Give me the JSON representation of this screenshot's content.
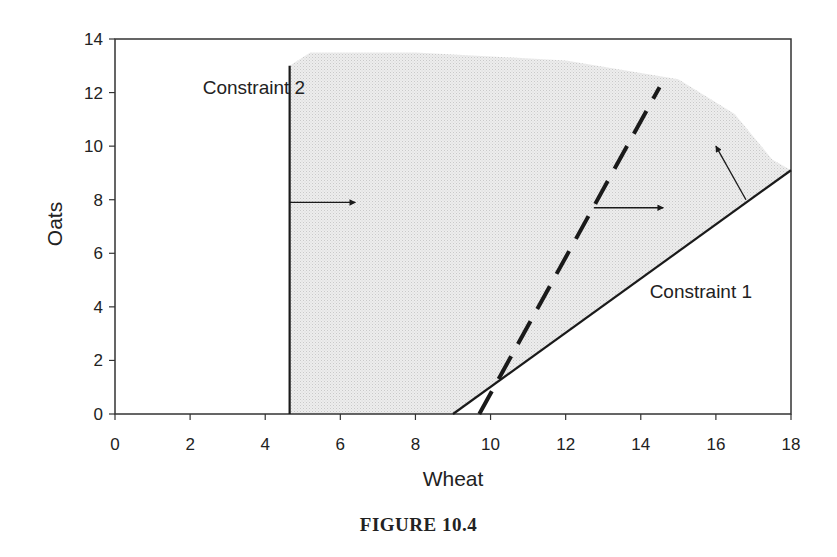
{
  "caption": "FIGURE 10.4",
  "chart_data": {
    "type": "line",
    "title": "",
    "xlabel": "Wheat",
    "ylabel": "Oats",
    "xlim": [
      0,
      18
    ],
    "ylim": [
      0,
      14
    ],
    "xticks": [
      0,
      2,
      4,
      6,
      8,
      10,
      12,
      14,
      16,
      18
    ],
    "yticks": [
      0,
      2,
      4,
      6,
      8,
      10,
      12,
      14
    ],
    "grid": false,
    "legend": null,
    "series": [
      {
        "name": "Constraint 1",
        "style": "solid",
        "x": [
          9.0,
          18.0
        ],
        "y": [
          0.0,
          9.1
        ],
        "direction_arrow": {
          "from": [
            16.8,
            8.0
          ],
          "to": [
            16.0,
            10.0
          ]
        }
      },
      {
        "name": "Constraint 2",
        "style": "solid",
        "x": [
          4.65,
          4.65
        ],
        "y": [
          0.0,
          13.0
        ],
        "direction_arrow": {
          "from": [
            4.65,
            7.9
          ],
          "to": [
            6.4,
            7.9
          ]
        }
      },
      {
        "name": "Objective / additional constraint (dashed)",
        "style": "dashed",
        "x": [
          9.7,
          14.5
        ],
        "y": [
          0.0,
          12.2
        ],
        "direction_arrow": {
          "from": [
            12.75,
            7.7
          ],
          "to": [
            14.6,
            7.7
          ]
        }
      }
    ],
    "shaded_region": {
      "description": "Feasible region (stippled grey), right of Constraint 2 and above Constraint 1",
      "boundary": [
        [
          4.65,
          0
        ],
        [
          9.0,
          0
        ],
        [
          18.0,
          9.1
        ],
        [
          17.5,
          9.5
        ],
        [
          16.5,
          11.2
        ],
        [
          15.0,
          12.5
        ],
        [
          12.0,
          13.2
        ],
        [
          8.0,
          13.5
        ],
        [
          5.2,
          13.5
        ],
        [
          4.65,
          13.0
        ]
      ]
    },
    "annotations": [
      {
        "text": "Constraint 2",
        "x": 3.7,
        "y": 12.2
      },
      {
        "text": "Constraint 1",
        "x": 15.6,
        "y": 4.6
      }
    ]
  }
}
